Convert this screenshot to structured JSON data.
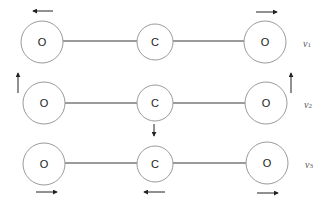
{
  "diagram": {
    "molecule": [
      "O",
      "C",
      "O"
    ],
    "modes": [
      {
        "symbol": "ν",
        "subscript": "1",
        "atoms": [
          {
            "label": "O",
            "displacement": "left"
          },
          {
            "label": "C",
            "displacement": "none"
          },
          {
            "label": "O",
            "displacement": "right"
          }
        ]
      },
      {
        "symbol": "ν",
        "subscript": "2",
        "atoms": [
          {
            "label": "O",
            "displacement": "up"
          },
          {
            "label": "C",
            "displacement": "down"
          },
          {
            "label": "O",
            "displacement": "up"
          }
        ]
      },
      {
        "symbol": "ν",
        "subscript": "3",
        "atoms": [
          {
            "label": "O",
            "displacement": "right"
          },
          {
            "label": "C",
            "displacement": "left"
          },
          {
            "label": "O",
            "displacement": "right"
          }
        ]
      }
    ],
    "colors": {
      "circle_stroke": "#9a9a9a",
      "bond": "#7a7a7a",
      "arrow": "#222222"
    }
  }
}
